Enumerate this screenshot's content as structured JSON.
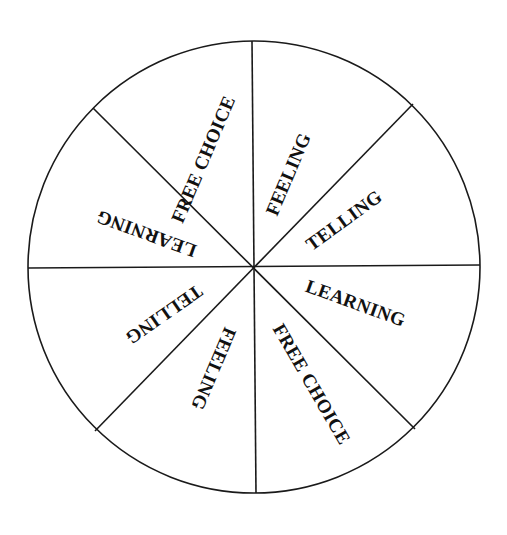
{
  "diagram": {
    "type": "segmented-wheel",
    "segment_count": 8,
    "colors": {
      "background": "#ffffff",
      "stroke": "#1a1a1a",
      "text": "#111111"
    },
    "segments": [
      {
        "label": "FREE CHOICE",
        "position": "top-left"
      },
      {
        "label": "FEELING",
        "position": "top-right"
      },
      {
        "label": "TELLING",
        "position": "right-upper"
      },
      {
        "label": "LEARNING",
        "position": "right-lower"
      },
      {
        "label": "FREE CHOICE",
        "position": "bottom-right"
      },
      {
        "label": "FEELING",
        "position": "bottom-left"
      },
      {
        "label": "TELLING",
        "position": "left-lower"
      },
      {
        "label": "LEARNING",
        "position": "left-upper"
      }
    ]
  }
}
